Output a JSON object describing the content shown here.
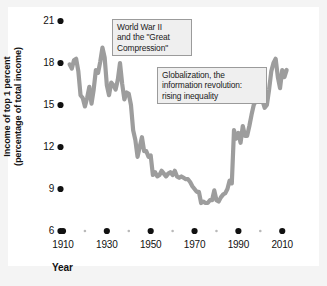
{
  "chart_data": {
    "type": "line",
    "title": "",
    "xlabel": "Year",
    "ylabel": "Income of top 1 percent (percentage of total income)",
    "ylabel_line1": "Income of top 1 percent",
    "ylabel_line2": "(percentage of total income)",
    "xlim": [
      1910,
      2014
    ],
    "ylim": [
      6,
      21
    ],
    "grid": false,
    "legend": "none",
    "line_color": "#9d9d9d",
    "xticks": [
      1910,
      1930,
      1950,
      1970,
      1990,
      2010
    ],
    "xtick_labels": [
      "1910",
      "1930",
      "1950",
      "1970",
      "1990",
      "2010"
    ],
    "xminor_ticks": [
      1920,
      1940,
      1960,
      1980,
      2000
    ],
    "yticks": [
      6,
      9,
      12,
      15,
      18,
      21
    ],
    "ytick_labels": [
      "6",
      "9",
      "12",
      "15",
      "18",
      "21"
    ],
    "series": [
      {
        "name": "Income share of top 1 percent",
        "x": [
          1913,
          1914,
          1915,
          1916,
          1917,
          1918,
          1919,
          1920,
          1921,
          1922,
          1923,
          1924,
          1925,
          1926,
          1927,
          1928,
          1929,
          1930,
          1931,
          1932,
          1933,
          1934,
          1935,
          1936,
          1937,
          1938,
          1939,
          1940,
          1941,
          1942,
          1943,
          1944,
          1945,
          1946,
          1947,
          1948,
          1949,
          1950,
          1951,
          1952,
          1953,
          1954,
          1955,
          1956,
          1957,
          1958,
          1959,
          1960,
          1961,
          1962,
          1963,
          1964,
          1965,
          1966,
          1967,
          1968,
          1969,
          1970,
          1971,
          1972,
          1973,
          1974,
          1975,
          1976,
          1977,
          1978,
          1979,
          1980,
          1981,
          1982,
          1983,
          1984,
          1985,
          1986,
          1987,
          1988,
          1989,
          1990,
          1991,
          1992,
          1993,
          1994,
          1995,
          1996,
          1997,
          1998,
          1999,
          2000,
          2001,
          2002,
          2003,
          2004,
          2005,
          2006,
          2007,
          2008,
          2009,
          2010,
          2011,
          2012
        ],
        "y": [
          17.9,
          17.6,
          18.2,
          18.3,
          17.4,
          15.7,
          15.5,
          14.9,
          15.5,
          16.3,
          15.1,
          16.1,
          17.5,
          17.3,
          18.1,
          19.1,
          18.4,
          16.4,
          15.7,
          16.6,
          16.4,
          16.1,
          16.8,
          18.0,
          16.5,
          15.4,
          15.9,
          15.8,
          15.0,
          13.2,
          12.5,
          11.3,
          12.0,
          12.7,
          11.7,
          11.7,
          11.3,
          11.4,
          10.0,
          10.2,
          9.9,
          10.0,
          10.3,
          10.1,
          9.9,
          10.1,
          10.2,
          10.0,
          10.3,
          9.9,
          9.8,
          9.9,
          9.8,
          9.7,
          9.7,
          9.5,
          9.2,
          9.0,
          8.8,
          8.8,
          8.0,
          8.1,
          8.0,
          8.0,
          8.2,
          8.2,
          8.9,
          8.2,
          8.1,
          8.4,
          8.6,
          8.7,
          9.0,
          9.6,
          9.4,
          13.2,
          12.6,
          13.0,
          12.3,
          13.5,
          12.8,
          12.8,
          13.5,
          14.3,
          15.0,
          15.3,
          16.3,
          16.5,
          15.3,
          14.8,
          15.0,
          16.1,
          17.4,
          18.0,
          18.3,
          17.0,
          16.2,
          17.5,
          17.0,
          17.5
        ]
      }
    ],
    "annotations": [
      {
        "id": "annot-ww2",
        "lines": [
          "World War II",
          "and the \"Great",
          "Compression\""
        ],
        "text": "World War II and the \"Great Compression\""
      },
      {
        "id": "annot-glob",
        "lines": [
          "Globalization, the",
          "information revolution:",
          "rising inequality"
        ],
        "text": "Globalization, the information revolution: rising inequality"
      }
    ]
  }
}
